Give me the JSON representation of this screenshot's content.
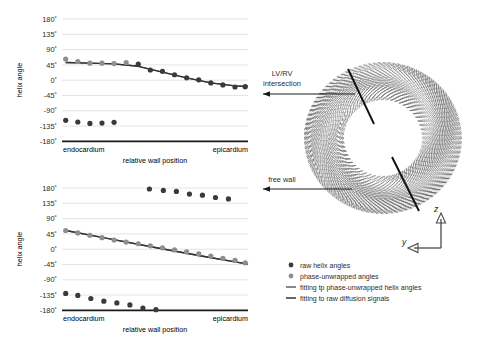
{
  "figure": {
    "title": "",
    "background": "#ffffff"
  },
  "colors": {
    "raw_point": "#3a3a3a",
    "unwrapped_point": "#8e8e8e",
    "fit_unwrapped_line": "#5f5f5f",
    "fit_raw_line": "#333333",
    "grid": "#d9d9d9",
    "axis": "#1a1a1a",
    "ring_fiber": "#6b6b6b",
    "marker_line": "#111111"
  },
  "chart_data": [
    {
      "id": "top-plot",
      "type": "scatter",
      "title": "",
      "xlabel": "relative wall position",
      "ylabel": "helix angle",
      "xlim": [
        0,
        1
      ],
      "ylim": [
        -180,
        180
      ],
      "yticks": [
        180,
        135,
        90,
        45,
        0,
        -45,
        -90,
        -135,
        -180
      ],
      "ytick_labels": [
        "180˚",
        "135˚",
        "90˚",
        "45˚",
        "0˚",
        "-45˚",
        "-90˚",
        "-135˚",
        "-180˚"
      ],
      "xtick_labels": [
        "endocardium",
        "epicardium"
      ],
      "grid": true,
      "legend_position": "external-bottom-right",
      "series": [
        {
          "name": "phase-unwrapped angles",
          "marker": "circle",
          "color": "#8e8e8e",
          "x": [
            0.02,
            0.085,
            0.15,
            0.215,
            0.28,
            0.345
          ],
          "y": [
            62,
            55,
            50,
            50,
            49,
            52
          ]
        },
        {
          "name": "raw helix angles",
          "marker": "circle",
          "color": "#3a3a3a",
          "x": [
            0.41,
            0.475,
            0.54,
            0.605,
            0.67,
            0.735,
            0.8,
            0.865,
            0.93,
            0.985,
            0.02,
            0.085,
            0.15,
            0.215,
            0.28
          ],
          "y": [
            47,
            30,
            26,
            16,
            7,
            1,
            -8,
            -14,
            -20,
            -19,
            -118,
            -123,
            -127,
            -126,
            -124
          ]
        },
        {
          "name": "fitting tp phase-unwrapped helix angles",
          "marker": "line",
          "color": "#5f5f5f",
          "x": [
            0.02,
            0.15,
            0.28,
            0.41,
            0.54,
            0.67,
            0.8,
            0.93,
            1.0
          ],
          "y": [
            52,
            50,
            48,
            41,
            24,
            7,
            -8,
            -17,
            -18
          ]
        },
        {
          "name": "fitting to raw diffusion signals",
          "marker": "line",
          "color": "#333333",
          "x": [
            0.02,
            0.15,
            0.28,
            0.41,
            0.54,
            0.67,
            0.8,
            0.93,
            1.0
          ],
          "y": [
            52,
            50,
            48,
            41,
            24,
            7,
            -8,
            -17,
            -18
          ]
        }
      ]
    },
    {
      "id": "bottom-plot",
      "type": "scatter",
      "title": "",
      "xlabel": "relative wall position",
      "ylabel": "helix angle",
      "xlim": [
        0,
        1
      ],
      "ylim": [
        -180,
        180
      ],
      "yticks": [
        180,
        135,
        90,
        45,
        0,
        -45,
        -90,
        -135,
        -180
      ],
      "ytick_labels": [
        "180˚",
        "135˚",
        "90˚",
        "45˚",
        "0˚",
        "-45˚",
        "-90˚",
        "-135˚",
        "-180˚"
      ],
      "xtick_labels": [
        "endocardium",
        "epicardium"
      ],
      "grid": true,
      "legend_position": "external-right",
      "series": [
        {
          "name": "phase-unwrapped angles",
          "marker": "circle",
          "color": "#8e8e8e",
          "x": [
            0.02,
            0.085,
            0.15,
            0.215,
            0.28,
            0.345,
            0.41,
            0.475,
            0.54,
            0.605,
            0.67,
            0.735,
            0.8,
            0.865,
            0.93,
            0.985
          ],
          "y": [
            55,
            48,
            41,
            34,
            27,
            21,
            16,
            10,
            4,
            -2,
            -8,
            -14,
            -20,
            -27,
            -33,
            -40
          ]
        },
        {
          "name": "raw helix angles",
          "marker": "circle",
          "color": "#3a3a3a",
          "x": [
            0.47,
            0.545,
            0.615,
            0.685,
            0.755,
            0.825,
            0.895,
            0.02,
            0.085,
            0.155,
            0.225,
            0.295,
            0.365,
            0.435,
            0.505
          ],
          "y": [
            177,
            173,
            170,
            162,
            159,
            152,
            148,
            -130,
            -136,
            -145,
            -153,
            -158,
            -164,
            -173,
            -178
          ]
        },
        {
          "name": "fitting tp phase-unwrapped helix angles",
          "marker": "line",
          "color": "#5f5f5f",
          "x": [
            0.02,
            0.25,
            0.5,
            0.75,
            1.0
          ],
          "y": [
            55,
            31,
            5,
            -20,
            -44
          ]
        },
        {
          "name": "fitting to raw diffusion signals",
          "marker": "line",
          "color": "#333333",
          "x": [
            0.02,
            0.25,
            0.5,
            0.75,
            1.0
          ],
          "y": [
            55,
            31,
            5,
            -20,
            -44
          ]
        }
      ]
    }
  ],
  "legend": {
    "items": [
      {
        "label": "raw helix angles",
        "type": "dot",
        "color": "#3a3a3a"
      },
      {
        "label": "phase-unwrapped angles",
        "type": "dot",
        "color": "#8e8e8e"
      },
      {
        "label": "fitting tp phase-unwrapped helix angles",
        "type": "line",
        "color": "#5f5f5f"
      },
      {
        "label": "fitting to raw diffusion signals",
        "type": "line",
        "color": "#333333"
      }
    ]
  },
  "diagram": {
    "name": "cardiac-short-axis-fiber-ring",
    "annotations": [
      {
        "id": "lv-rv",
        "label": "LV/RV\nintersection",
        "line1": "LV/RV",
        "line2": "intersection"
      },
      {
        "id": "free-wall",
        "label": "free wall",
        "line1": "free wall",
        "line2": ""
      }
    ],
    "axis_indicator": {
      "vertical_label": "z",
      "horizontal_label": "y"
    }
  }
}
